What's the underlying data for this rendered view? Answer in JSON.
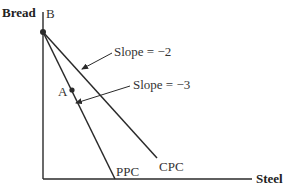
{
  "diagram": {
    "type": "production-consumption-possibility",
    "axes": {
      "y_label": "Bread",
      "x_label": "Steel"
    },
    "points": {
      "B": "B",
      "A": "A"
    },
    "curves": {
      "ppc": "PPC",
      "cpc": "CPC"
    },
    "annotations": {
      "cpc_slope": "Slope = −2",
      "ppc_slope": "Slope = −3"
    },
    "colors": {
      "line": "#2a2a2a",
      "text": "#333333"
    }
  }
}
